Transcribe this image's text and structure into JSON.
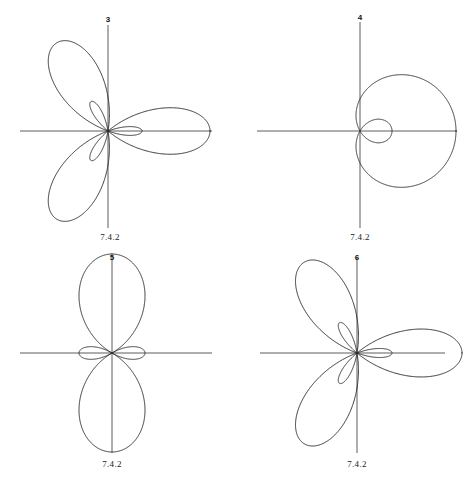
{
  "figure": {
    "background_color": "#ffffff",
    "curve_color": "#2b2b2b",
    "axis_color": "#4a4a4a",
    "caption_text": "7.4.2"
  },
  "chart_data": {
    "type": "line",
    "title": "",
    "subtitle": "",
    "xlabel": "",
    "ylabel": "",
    "grid": false,
    "legend_position": "none",
    "coordinate_system": "polar",
    "panels": [
      {
        "id": "panel-3",
        "number_label": "3",
        "caption": "7.4.2",
        "equation": "r = 1 + 2*cos(3*theta)",
        "n": 3,
        "a": 1,
        "b": 2,
        "inner_loops": 3,
        "outer_lobes": 3,
        "theta_start": 0,
        "theta_end": 6.283185307179586,
        "samples": 1400,
        "rotation_deg": 0,
        "center_x": 108,
        "center_y": 131,
        "scale": 34,
        "axis_x": {
          "x1": 20,
          "x2": 212,
          "y": 131
        },
        "axis_y": {
          "y1": 25,
          "y2": 228,
          "x": 108
        },
        "top_label_x": 108,
        "top_label_y": 16,
        "bottom_label_x": 110,
        "bottom_label_y": 233
      },
      {
        "id": "panel-4",
        "number_label": "4",
        "caption": "7.4.2",
        "equation": "r = 1 + 2*cos(theta)",
        "n": 1,
        "a": 1,
        "b": 2,
        "inner_loops": 1,
        "outer_lobes": 1,
        "theta_start": 0,
        "theta_end": 6.283185307179586,
        "samples": 1400,
        "rotation_deg": 0,
        "center_x": 125,
        "center_y": 131,
        "scale": 32,
        "axis_x": {
          "x1": 22,
          "x2": 222,
          "y": 131
        },
        "axis_y": {
          "y1": 22,
          "y2": 228,
          "x": 125
        },
        "top_label_x": 125,
        "top_label_y": 14,
        "bottom_label_x": 125,
        "bottom_label_y": 233
      },
      {
        "id": "panel-5",
        "number_label": "5",
        "caption": "7.4.2",
        "equation": "r = 1 + 2*cos(2*theta)",
        "n": 2,
        "a": 1,
        "b": 2,
        "inner_loops": 2,
        "outer_lobes": 2,
        "theta_start": 0,
        "theta_end": 6.283185307179586,
        "samples": 1400,
        "rotation_deg": 90,
        "center_x": 112,
        "center_y": 112,
        "scale": 33,
        "axis_x": {
          "x1": 20,
          "x2": 212,
          "y": 112
        },
        "axis_y": {
          "y1": 16,
          "y2": 212,
          "x": 112
        },
        "top_label_x": 112,
        "top_label_y": 13,
        "bottom_label_x": 112,
        "bottom_label_y": 219
      },
      {
        "id": "panel-6",
        "number_label": "6",
        "caption": "7.4.2",
        "equation": "r = 1 + 2*cos(3*theta)",
        "n": 3,
        "a": 1,
        "b": 2,
        "inner_loops": 3,
        "outer_lobes": 3,
        "theta_start": 0,
        "theta_end": 6.283185307179586,
        "samples": 1400,
        "rotation_deg": 0,
        "center_x": 122,
        "center_y": 112,
        "scale": 35,
        "axis_x": {
          "x1": 25,
          "x2": 210,
          "y": 112
        },
        "axis_y": {
          "y1": 16,
          "y2": 212,
          "x": 122
        },
        "top_label_x": 122,
        "top_label_y": 13,
        "bottom_label_x": 122,
        "bottom_label_y": 219
      }
    ]
  }
}
